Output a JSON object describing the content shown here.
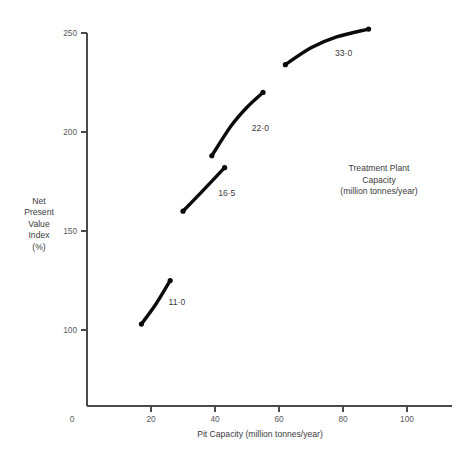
{
  "chart_data": {
    "type": "line",
    "title": "",
    "xlabel": "Pit Capacity (million tonnes/year)",
    "ylabel": "Net Present Value Index (%)",
    "ylabel_lines": [
      "Net",
      "Present",
      "Value",
      "Index",
      "(%)"
    ],
    "xlim": [
      0,
      107
    ],
    "ylim": [
      0,
      258
    ],
    "grid": false,
    "legend": "inline-labels",
    "x_ticks": [
      0,
      20,
      40,
      60,
      80,
      100
    ],
    "x_tick_labels": [
      "0",
      "20",
      "40",
      "60",
      "80",
      "100"
    ],
    "y_ticks": [
      100,
      150,
      200,
      250
    ],
    "y_tick_labels": [
      "100",
      "150",
      "200",
      "250"
    ],
    "annotation": {
      "lines": [
        "Treatment Plant",
        "Capacity",
        "(million tonnes/year)"
      ]
    },
    "series": [
      {
        "name": "11·0",
        "label": "11·0",
        "label_x": 25.5,
        "label_y": 114,
        "x": [
          17.0,
          21.5,
          26.0
        ],
        "y": [
          103.0,
          113.0,
          125.0
        ]
      },
      {
        "name": "16·5",
        "label": "16·5",
        "label_x": 41.0,
        "label_y": 169,
        "x": [
          30.0,
          36.0,
          43.0
        ],
        "y": [
          160.0,
          170.0,
          182.0
        ]
      },
      {
        "name": "22·0",
        "label": "22·0",
        "label_x": 51.5,
        "label_y": 202,
        "x": [
          39.0,
          45.0,
          50.0,
          55.0
        ],
        "y": [
          188.0,
          203.0,
          212.5,
          220.0
        ]
      },
      {
        "name": "33·0",
        "label": "33·0",
        "label_x": 77.5,
        "label_y": 240,
        "x": [
          62.0,
          70.0,
          78.0,
          88.0
        ],
        "y": [
          234.0,
          242.5,
          248.0,
          252.0
        ]
      }
    ]
  }
}
